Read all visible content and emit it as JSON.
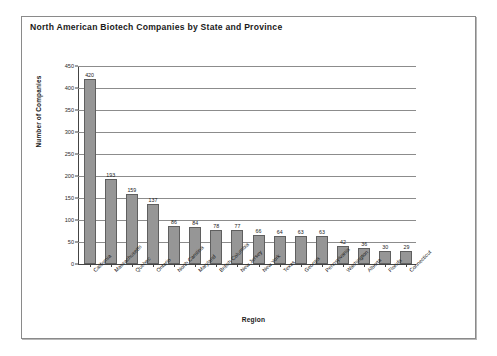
{
  "chart_data": {
    "type": "bar",
    "title": "North American Biotech Companies by State and Province",
    "xlabel": "Region",
    "ylabel": "Number of Companies",
    "ylim": [
      0,
      450
    ],
    "yticks": [
      0,
      50,
      100,
      150,
      200,
      250,
      300,
      350,
      400,
      450
    ],
    "grid": true,
    "legend": "none",
    "bar_color": "#969696",
    "bar_edge_color": "#5f5f5f",
    "categories": [
      "California",
      "Massachusetts",
      "Quebec",
      "Ontario",
      "North Carolina",
      "Maryland",
      "British Columbia",
      "New Jersey",
      "New York",
      "Texas",
      "Georgia",
      "Pennsylvania",
      "Washington",
      "Alberta",
      "Florida",
      "Connecticut"
    ],
    "values": [
      420,
      193,
      159,
      137,
      86,
      84,
      78,
      77,
      66,
      64,
      63,
      63,
      42,
      36,
      30,
      29
    ],
    "data_labels": [
      "420",
      "193",
      "159",
      "137",
      "86",
      "84",
      "78",
      "77",
      "66",
      "64",
      "63",
      "63",
      "42",
      "36",
      "30",
      "29"
    ]
  }
}
